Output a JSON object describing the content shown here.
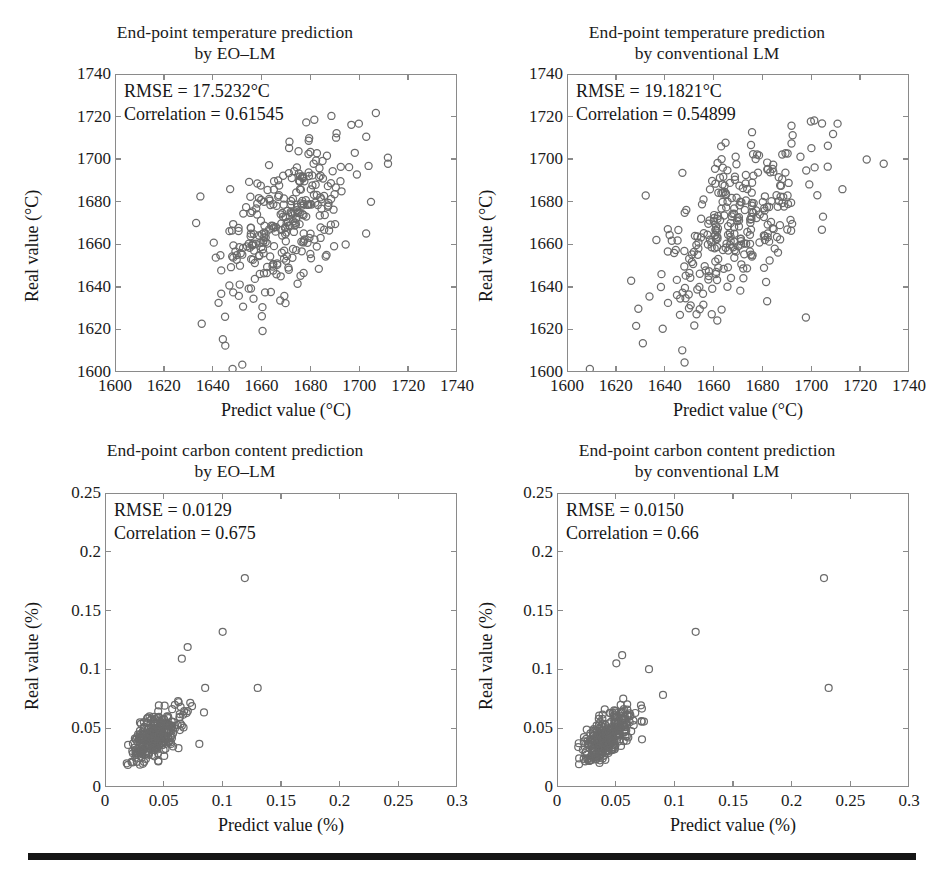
{
  "figure": {
    "bottom_rule": "horizontal-rule",
    "marker_color": "#6b6b6b",
    "axis_color": "#8a8a8a",
    "text_color": "#161616"
  },
  "panels": [
    {
      "id": "top-left",
      "title_line1": "End-point temperature prediction",
      "title_line2": "by EO–LM",
      "rmse_label": "RMSE = 17.5232°C",
      "correlation_label": "Correlation = 0.61545",
      "xlabel": "Predict value (°C)",
      "ylabel": "Real value (°C)",
      "xticks": [
        "1600",
        "1620",
        "1640",
        "1660",
        "1680",
        "1700",
        "1720",
        "1740"
      ],
      "yticks": [
        "1600",
        "1620",
        "1640",
        "1660",
        "1680",
        "1700",
        "1720",
        "1740"
      ]
    },
    {
      "id": "top-right",
      "title_line1": "End-point temperature prediction",
      "title_line2": "by conventional LM",
      "rmse_label": "RMSE = 19.1821°C",
      "correlation_label": "Correlation = 0.54899",
      "xlabel": "Predict value (°C)",
      "ylabel": "Real value (°C)",
      "xticks": [
        "1600",
        "1620",
        "1640",
        "1660",
        "1680",
        "1700",
        "1720",
        "1740"
      ],
      "yticks": [
        "1600",
        "1620",
        "1640",
        "1660",
        "1680",
        "1700",
        "1720",
        "1740"
      ]
    },
    {
      "id": "bottom-left",
      "title_line1": "End-point carbon content prediction",
      "title_line2": "by EO–LM",
      "rmse_label": "RMSE = 0.0129",
      "correlation_label": "Correlation = 0.675",
      "xlabel": "Predict value (%)",
      "ylabel": "Real value (%)",
      "xticks": [
        "0",
        "0.05",
        "0.1",
        "0.15",
        "0.2",
        "0.25",
        "0.3"
      ],
      "yticks": [
        "0",
        "0.05",
        "0.1",
        "0.15",
        "0.2",
        "0.25"
      ]
    },
    {
      "id": "bottom-right",
      "title_line1": "End-point carbon content prediction",
      "title_line2": "by conventional LM",
      "rmse_label": "RMSE = 0.0150",
      "correlation_label": "Correlation = 0.66",
      "xlabel": "Predict value (%)",
      "ylabel": "Real value (%)",
      "xticks": [
        "0",
        "0.05",
        "0.1",
        "0.15",
        "0.2",
        "0.25",
        "0.3"
      ],
      "yticks": [
        "0",
        "0.05",
        "0.1",
        "0.15",
        "0.2",
        "0.25"
      ]
    }
  ],
  "chart_data": [
    {
      "type": "scatter",
      "id": "top-left",
      "title": "End-point temperature prediction by EO–LM",
      "xlabel": "Predict value (°C)",
      "ylabel": "Real value (°C)",
      "xlim": [
        1600,
        1740
      ],
      "ylim": [
        1600,
        1740
      ],
      "xticks": [
        1600,
        1620,
        1640,
        1660,
        1680,
        1700,
        1720,
        1740
      ],
      "yticks": [
        1600,
        1620,
        1640,
        1660,
        1680,
        1700,
        1720,
        1740
      ],
      "grid": false,
      "legend": null,
      "annotations": [
        "RMSE = 17.5232°C",
        "Correlation = 0.61545"
      ],
      "rmse": 17.5232,
      "correlation": 0.61545,
      "n_points": 300,
      "marker": "open-circle",
      "cluster": {
        "x_mean": 1668,
        "x_std": 13,
        "y_mean": 1668,
        "y_std": 19,
        "rho": 0.61545,
        "x_range": [
          1633,
          1712
        ],
        "y_range": [
          1600,
          1722
        ]
      },
      "notable_points": [
        [
          1633,
          1670
        ],
        [
          1707,
          1722
        ],
        [
          1700,
          1717
        ],
        [
          1704,
          1697
        ],
        [
          1712,
          1698
        ],
        [
          1705,
          1680
        ],
        [
          1703,
          1665
        ],
        [
          1648,
          1601
        ],
        [
          1652,
          1603
        ],
        [
          1645,
          1612
        ],
        [
          1644,
          1615
        ]
      ]
    },
    {
      "type": "scatter",
      "id": "top-right",
      "title": "End-point temperature prediction by conventional LM",
      "xlabel": "Predict value (°C)",
      "ylabel": "Real value (°C)",
      "xlim": [
        1600,
        1740
      ],
      "ylim": [
        1600,
        1740
      ],
      "xticks": [
        1600,
        1620,
        1640,
        1660,
        1680,
        1700,
        1720,
        1740
      ],
      "yticks": [
        1600,
        1620,
        1640,
        1660,
        1680,
        1700,
        1720,
        1740
      ],
      "grid": false,
      "legend": null,
      "annotations": [
        "RMSE = 19.1821°C",
        "Correlation = 0.54899"
      ],
      "rmse": 19.1821,
      "correlation": 0.54899,
      "n_points": 300,
      "marker": "open-circle",
      "cluster": {
        "x_mean": 1667,
        "x_std": 15,
        "y_mean": 1668,
        "y_std": 20,
        "rho": 0.54899,
        "x_range": [
          1609,
          1732
        ],
        "y_range": [
          1600,
          1722
        ]
      },
      "notable_points": [
        [
          1609,
          1601
        ],
        [
          1632,
          1683
        ],
        [
          1700,
          1718
        ],
        [
          1711,
          1717
        ],
        [
          1723,
          1700
        ],
        [
          1730,
          1698
        ],
        [
          1713,
          1686
        ],
        [
          1705,
          1673
        ],
        [
          1682,
          1633
        ],
        [
          1648,
          1604
        ],
        [
          1639,
          1620
        ]
      ]
    },
    {
      "type": "scatter",
      "id": "bottom-left",
      "title": "End-point carbon content prediction by EO–LM",
      "xlabel": "Predict value (%)",
      "ylabel": "Real value (%)",
      "xlim": [
        0,
        0.3
      ],
      "ylim": [
        0,
        0.25
      ],
      "xticks": [
        0,
        0.05,
        0.1,
        0.15,
        0.2,
        0.25,
        0.3
      ],
      "yticks": [
        0,
        0.05,
        0.1,
        0.15,
        0.2,
        0.25
      ],
      "grid": false,
      "legend": null,
      "annotations": [
        "RMSE = 0.0129",
        "Correlation = 0.675"
      ],
      "rmse": 0.0129,
      "correlation": 0.675,
      "n_points": 300,
      "marker": "open-circle",
      "cluster": {
        "x_mean": 0.042,
        "x_std": 0.0115,
        "y_mean": 0.042,
        "y_std": 0.0125,
        "rho": 0.675,
        "x_range": [
          0.016,
          0.088
        ],
        "y_range": [
          0.018,
          0.096
        ]
      },
      "notable_points": [
        [
          0.119,
          0.178
        ],
        [
          0.1,
          0.132
        ],
        [
          0.13,
          0.084
        ],
        [
          0.07,
          0.119
        ],
        [
          0.065,
          0.109
        ],
        [
          0.085,
          0.084
        ],
        [
          0.08,
          0.036
        ],
        [
          0.084,
          0.063
        ]
      ]
    },
    {
      "type": "scatter",
      "id": "bottom-right",
      "title": "End-point carbon content prediction by conventional LM",
      "xlabel": "Predict value (%)",
      "ylabel": "Real value (%)",
      "xlim": [
        0,
        0.3
      ],
      "ylim": [
        0,
        0.25
      ],
      "xticks": [
        0,
        0.05,
        0.1,
        0.15,
        0.2,
        0.25,
        0.3
      ],
      "yticks": [
        0,
        0.05,
        0.1,
        0.15,
        0.2,
        0.25
      ],
      "grid": false,
      "legend": null,
      "annotations": [
        "RMSE = 0.0150",
        "Correlation = 0.66"
      ],
      "rmse": 0.015,
      "correlation": 0.66,
      "n_points": 300,
      "marker": "open-circle",
      "cluster": {
        "x_mean": 0.042,
        "x_std": 0.012,
        "y_mean": 0.042,
        "y_std": 0.0125,
        "rho": 0.66,
        "x_range": [
          0.016,
          0.092
        ],
        "y_range": [
          0.018,
          0.1
        ]
      },
      "notable_points": [
        [
          0.228,
          0.178
        ],
        [
          0.118,
          0.132
        ],
        [
          0.232,
          0.084
        ],
        [
          0.055,
          0.112
        ],
        [
          0.05,
          0.105
        ],
        [
          0.078,
          0.1
        ],
        [
          0.09,
          0.078
        ],
        [
          0.072,
          0.04
        ]
      ]
    }
  ]
}
